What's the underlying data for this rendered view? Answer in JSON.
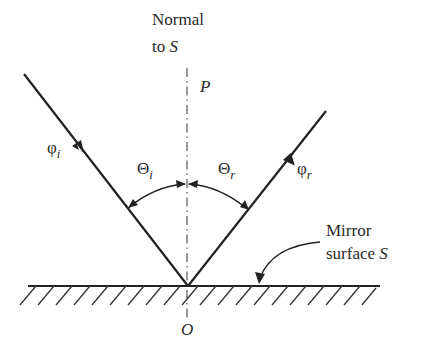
{
  "diagram": {
    "colors": {
      "stroke": "#222222",
      "text": "#2a2a2a",
      "background": "#ffffff"
    },
    "labels": {
      "normal_line1": "Normal",
      "normal_line2_prefix": "to ",
      "normal_line2_symbol": "S",
      "point_p": "P",
      "point_o": "O",
      "incident_ray_symbol": "φ",
      "incident_ray_sub": "i",
      "reflected_ray_symbol": "φ",
      "reflected_ray_sub": "r",
      "incidence_angle_symbol": "Θ",
      "incidence_angle_sub": "i",
      "reflection_angle_symbol": "Θ",
      "reflection_angle_sub": "r",
      "mirror_line1": "Mirror",
      "mirror_line2_prefix": "surface ",
      "mirror_line2_symbol": "S"
    },
    "geometry": {
      "origin_O": [
        188,
        286
      ],
      "incident_start": [
        24,
        74
      ],
      "reflected_end": [
        326,
        111
      ],
      "surface_x_range": [
        28,
        380
      ],
      "normal_y_range": [
        68,
        320
      ]
    }
  }
}
